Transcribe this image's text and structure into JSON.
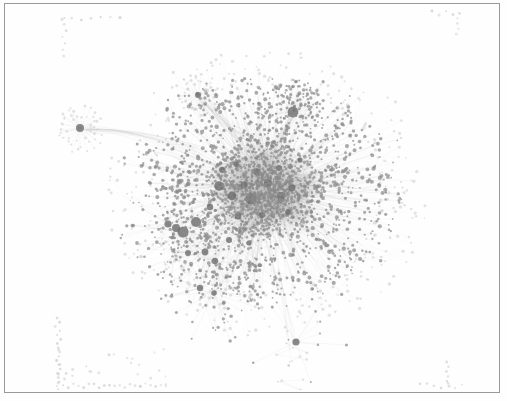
{
  "figure": {
    "kind": "network-graph",
    "title": "",
    "width": 507,
    "height": 401,
    "background_color": "#fefefe",
    "paper_color": "#ffffff"
  },
  "frame": {
    "label": "plot-border",
    "x": 4,
    "y": 3,
    "width": 494,
    "height": 388,
    "stroke_color": "#9a9a9a",
    "stroke_width": 1,
    "fill_color": "#ffffff"
  },
  "chart_data": {
    "type": "scatter",
    "subtype": "node-link-graph",
    "title": "",
    "xlabel": "",
    "ylabel": "",
    "grid": false,
    "legend": false,
    "axis_visible": false,
    "xlim": [
      0,
      507
    ],
    "ylim": [
      0,
      401
    ],
    "node_color": "#8a8a8a",
    "node_color_dark": "#6b6b6b",
    "node_color_light": "#c8c8c8",
    "edge_color": "#b9b9b9",
    "edge_opacity": 0.3,
    "node_opacity": 0.72,
    "summary": {
      "approx_node_count": 2400,
      "approx_edge_count": 4200,
      "components": 5,
      "layout": "force-directed"
    },
    "clusters": [
      {
        "name": "main-hairball-core",
        "center": [
          266,
          190
        ],
        "core_radius": 52,
        "halo_radius": 118,
        "node_count": 1500,
        "hub_count": 26,
        "density": "very-high"
      },
      {
        "name": "left-star-satellite",
        "center": [
          80,
          128
        ],
        "core_radius": 4,
        "halo_radius": 26,
        "node_count": 46,
        "hub_count": 1,
        "density": "radial-star"
      },
      {
        "name": "upper-star-satellite",
        "center": [
          198,
          95
        ],
        "core_radius": 3,
        "halo_radius": 24,
        "node_count": 40,
        "hub_count": 1,
        "density": "radial-star"
      },
      {
        "name": "upper-right-subcluster",
        "center": [
          293,
          112
        ],
        "core_radius": 9,
        "halo_radius": 34,
        "node_count": 120,
        "hub_count": 3,
        "density": "medium"
      },
      {
        "name": "lower-tendril",
        "center": [
          296,
          352
        ],
        "core_radius": 3,
        "halo_radius": 22,
        "node_count": 14,
        "hub_count": 1,
        "density": "sparse-chain"
      }
    ],
    "bridges": [
      {
        "name": "left-hub-to-core",
        "from": [
          86,
          130
        ],
        "to": [
          196,
          155
        ],
        "curve": -14,
        "strands": 16
      },
      {
        "name": "upper-star-to-core",
        "from": [
          201,
          99
        ],
        "to": [
          248,
          142
        ],
        "curve": 6,
        "strands": 22
      },
      {
        "name": "upper-right-to-core",
        "from": [
          292,
          118
        ],
        "to": [
          268,
          160
        ],
        "curve": -4,
        "strands": 18
      },
      {
        "name": "core-to-tendril",
        "from": [
          276,
          268
        ],
        "to": [
          296,
          344
        ],
        "curve": 5,
        "strands": 5
      }
    ],
    "isolate_groups": [
      {
        "name": "top-left-isolates",
        "orientation": "L-shape",
        "row_y": 18,
        "row_x_start": 62,
        "row_x_end": 120,
        "row_count": 7,
        "col_x": 64,
        "col_y_start": 18,
        "col_y_end": 56,
        "col_count": 7
      },
      {
        "name": "top-right-isolates",
        "orientation": "L-shape",
        "row_y": 13,
        "row_x_start": 432,
        "row_x_end": 460,
        "row_count": 5,
        "col_x": 458,
        "col_y_start": 13,
        "col_y_end": 34,
        "col_count": 5
      },
      {
        "name": "bottom-left-isolates",
        "orientation": "L-shape",
        "col_x": 58,
        "col_y_start": 318,
        "col_y_end": 386,
        "col_count": 17,
        "row_y": 386,
        "row_x_start": 58,
        "row_x_end": 166,
        "row_count": 22,
        "scatter_count": 26
      },
      {
        "name": "bottom-right-isolates",
        "orientation": "L-shape",
        "col_x": 448,
        "col_y_start": 362,
        "col_y_end": 386,
        "col_count": 6,
        "row_y": 386,
        "row_x_start": 420,
        "row_x_end": 462,
        "row_count": 7
      }
    ],
    "annotations": []
  },
  "captions": []
}
